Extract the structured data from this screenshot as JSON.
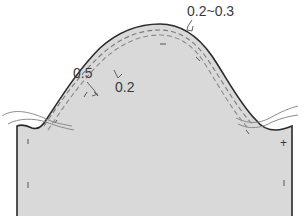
{
  "diagram": {
    "type": "sleeve-cap-pattern",
    "fill_color": "#d9d9d9",
    "outline_color": "#2a2a2a",
    "stitch_color": "#7a7a7a",
    "thread_color": "#8c8c8c",
    "labels": {
      "outer_allowance": "0.5",
      "inner_allowance": "0.2",
      "cap_allowance": "0.2~0.3"
    },
    "notch_marks": {
      "right_top": "+"
    }
  }
}
